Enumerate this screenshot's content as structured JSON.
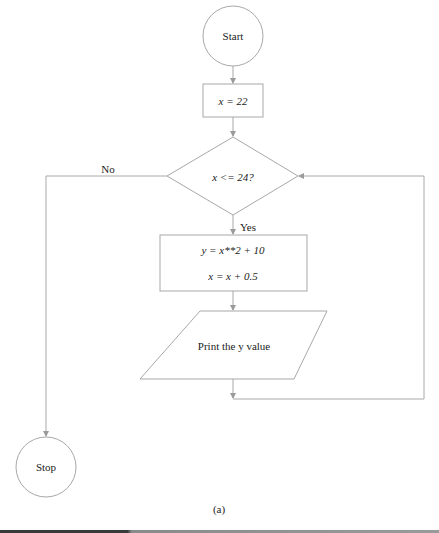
{
  "figure": {
    "caption": "(a)",
    "stroke_color": "#a0a0a0",
    "text_color": "#222222"
  },
  "nodes": {
    "start": {
      "type": "terminal",
      "label": "Start"
    },
    "init": {
      "type": "process",
      "label": "x = 22"
    },
    "decision": {
      "type": "decision",
      "label": "x <= 24?"
    },
    "compute": {
      "type": "process",
      "line1": "y = x**2 + 10",
      "line2": "x = x + 0.5"
    },
    "output": {
      "type": "io",
      "label": "Print the y value"
    },
    "stop": {
      "type": "terminal",
      "label": "Stop"
    }
  },
  "edges": {
    "no_label": "No",
    "yes_label": "Yes"
  }
}
